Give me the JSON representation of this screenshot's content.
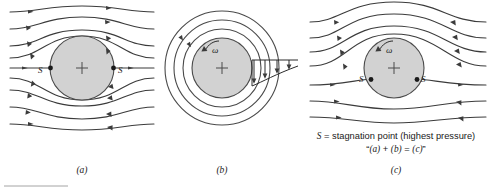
{
  "figure": {
    "background_color": "#ffffff",
    "body_fill_color": "#d2d2d2",
    "stroke_color": "#3b3b3b",
    "panels": [
      {
        "id": "a",
        "caption": "(a)",
        "description": "uniform stream past a non-rotating cylinder",
        "stagnation_labels": [
          "S",
          "S"
        ],
        "center_mark": "+",
        "has_rotation_arrow": false,
        "omega_label": ""
      },
      {
        "id": "b",
        "caption": "(b)",
        "description": "rotating cylinder in still fluid, circular streamlines",
        "stagnation_labels": [],
        "center_mark": "+",
        "has_rotation_arrow": true,
        "omega_label": "ω"
      },
      {
        "id": "c",
        "caption": "(c)",
        "description": "uniform stream past a rotating cylinder, stagnation points shifted down",
        "stagnation_labels": [
          "S",
          "S"
        ],
        "center_mark": "+",
        "has_rotation_arrow": true,
        "omega_label": "ω"
      }
    ],
    "notes": {
      "line1_prefix": "S",
      "line1_rest": " = stagnation point (highest pressure)",
      "line2_open_quote": "“",
      "line2_a": "(a)",
      "line2_plus": " + ",
      "line2_b": "(b)",
      "line2_eq": " = ",
      "line2_c": "(c)",
      "line2_close_quote": "”"
    }
  }
}
